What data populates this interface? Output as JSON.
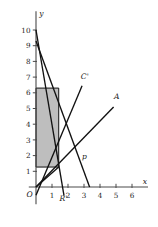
{
  "chart_data": {
    "type": "line",
    "title": "",
    "xlabel": "x",
    "ylabel": "y",
    "origin_label": "O",
    "xlim": [
      -0.45,
      7.0
    ],
    "ylim": [
      -1.1,
      11.2
    ],
    "grid": false,
    "legend": "none",
    "xticks": [
      1,
      2,
      3,
      4,
      5,
      6
    ],
    "xtick_labels": [
      "1",
      "2",
      "3",
      "4",
      "5",
      "6"
    ],
    "yticks": [
      1,
      2,
      3,
      4,
      5,
      6,
      7,
      8,
      9,
      10
    ],
    "ytick_labels": [
      "1",
      "2",
      "3",
      "4",
      "5",
      "6",
      "7",
      "8",
      "9",
      "10"
    ],
    "series": [
      {
        "name": "R-prime",
        "label": "R'",
        "label_x": 1.72,
        "label_y": -0.92,
        "x": [
          0.0,
          1.75
        ],
        "y": [
          10.0,
          -0.55
        ]
      },
      {
        "name": "p",
        "label": "p",
        "label_x": 3.03,
        "label_y": 1.78,
        "x": [
          0.0,
          3.35
        ],
        "y": [
          9.3,
          0.0
        ]
      },
      {
        "name": "C-prime",
        "label": "C'",
        "label_x": 3.05,
        "label_y": 6.85,
        "x": [
          0.0,
          2.88
        ],
        "y": [
          -0.52,
          6.45
        ]
      },
      {
        "name": "A",
        "label": "A",
        "label_x": 5.05,
        "label_y": 5.62,
        "x": [
          0.0,
          4.85
        ],
        "y": [
          0.0,
          5.1
        ]
      },
      {
        "name": "lower-boundary",
        "label": "",
        "label_x": 0,
        "label_y": 0,
        "x": [
          0.0,
          1.42
        ],
        "y": [
          0.0,
          1.27
        ]
      }
    ],
    "shaded_region": {
      "name": "feasible-region",
      "x_min": 0.0,
      "x_max": 1.42,
      "y_min": 1.27,
      "y_max": 6.3,
      "color": "#b0b0b0"
    },
    "colors": {
      "axis": "#4a4a4a",
      "line": "#111111",
      "shade": "#b0b0b0",
      "text": "#1a1a1a",
      "background": "#ffffff"
    }
  }
}
